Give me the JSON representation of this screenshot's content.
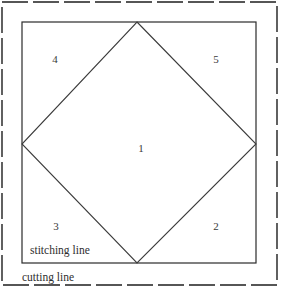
{
  "diagram": {
    "colors": {
      "background": "#ffffff",
      "stitching_line": "#2b2b2b",
      "cutting_line": "#1f1f1f",
      "diamond_line": "#3b3b3b",
      "label_text": "#3a3a3a",
      "annotation_text": "#2e2e2e"
    },
    "annotations": {
      "stitching_line_label": "stitching line",
      "cutting_line_label": "cutting line"
    },
    "pieces": [
      {
        "id": "1",
        "label": "1",
        "region": "center-diamond"
      },
      {
        "id": "2",
        "label": "2",
        "region": "bottom-right-triangle"
      },
      {
        "id": "3",
        "label": "3",
        "region": "bottom-left-triangle"
      },
      {
        "id": "4",
        "label": "4",
        "region": "top-left-triangle"
      },
      {
        "id": "5",
        "label": "5",
        "region": "top-right-triangle"
      }
    ],
    "geometry": {
      "cutting_rect": {
        "x": 2,
        "y": 2,
        "width": 275,
        "height": 283
      },
      "cutting_dash": "26 5",
      "stitching_rect": {
        "x": 22,
        "y": 22,
        "width": 234,
        "height": 241
      },
      "diamond_points": "137,22 256,144 137,263 22,144",
      "cutting_leader": {
        "x1": 68,
        "y1": 284,
        "x2": 277,
        "y2": 284
      }
    }
  }
}
